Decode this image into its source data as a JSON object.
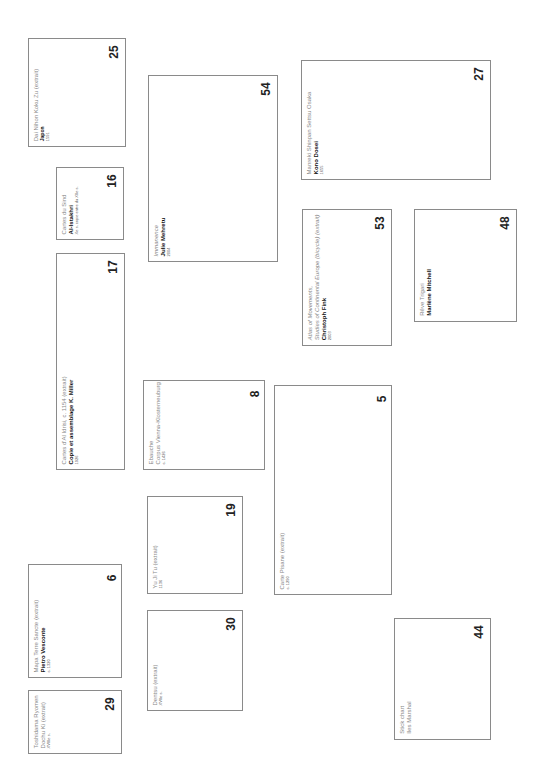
{
  "cards": [
    {
      "id": "25",
      "number": "25",
      "title": "Dai Nihon Koku Zu (extrait)",
      "author": "Japon",
      "date": "1591"
    },
    {
      "id": "16",
      "number": "16",
      "title": "Cartes du Sind",
      "author": "Al-Istakhri",
      "date": "Xe s. copie entre du XIIe s."
    },
    {
      "id": "17",
      "number": "17",
      "title": "Cartes d'Al Idrisi, c. 1154 (extrait)",
      "author": "Copie et assemblage K. Miller",
      "date": "1926"
    },
    {
      "id": "54",
      "number": "54",
      "title": "Immanence",
      "author": "Julie Mehretu",
      "date": "2004"
    },
    {
      "id": "8",
      "number": "8",
      "title": "Ebauche",
      "subtitle": "Corpus Vienna-Klosterneuburg",
      "date": "c. 1426"
    },
    {
      "id": "19",
      "number": "19",
      "title": "Yu Ji Tu (extrait)",
      "date": "1136"
    },
    {
      "id": "30",
      "number": "30",
      "title": "Dentsu (extrait)",
      "date": "XVIIe s."
    },
    {
      "id": "6",
      "number": "6",
      "title": "Mapa Terre Sancte (extrait)",
      "author": "Pietro Vesconte",
      "date": "c. 1320"
    },
    {
      "id": "29",
      "number": "29",
      "title": "Toshidama Ryomen",
      "subtitle": "Dochu Ki (extrait)",
      "date": "XVIIIe s."
    },
    {
      "id": "27",
      "number": "27",
      "title": "Manreki Shinpan Settsu Osaka",
      "author": "Kono Dosei",
      "date": "1655"
    },
    {
      "id": "53",
      "number": "53",
      "title": "Atlas of Movements,",
      "subtitle": "Studies of Continental Europe (bicycle) (extrait)",
      "author": "Christoph Fink",
      "date": "2003"
    },
    {
      "id": "48",
      "number": "48",
      "title": "Rêve Trigari",
      "author": "Marlène Mitchell"
    },
    {
      "id": "5",
      "number": "5",
      "title": "Carte Pisane (extrait)",
      "date": "c. 1290"
    },
    {
      "id": "44",
      "number": "44",
      "title": "Stick chart",
      "subtitle": "Iles Marshal"
    }
  ]
}
